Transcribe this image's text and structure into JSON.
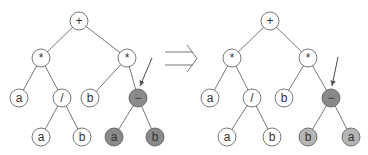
{
  "colors": {
    "line": "#555555",
    "node_fill": "#ffffff",
    "dark_fill": "#8a8a8a",
    "light_fill": "#b5b5b5"
  },
  "trees": [
    {
      "name": "before",
      "nodes": [
        {
          "id": "n0",
          "label": "+",
          "x": 79,
          "y": 21,
          "fill": "node_fill"
        },
        {
          "id": "n1",
          "label": "*",
          "x": 41,
          "y": 58,
          "fill": "node_fill"
        },
        {
          "id": "n2",
          "label": "*",
          "x": 127,
          "y": 58,
          "fill": "node_fill"
        },
        {
          "id": "n3",
          "label": "a",
          "x": 19,
          "y": 98,
          "fill": "node_fill"
        },
        {
          "id": "n4",
          "label": "/",
          "x": 62,
          "y": 98,
          "fill": "node_fill"
        },
        {
          "id": "n5",
          "label": "b",
          "x": 90,
          "y": 98,
          "fill": "node_fill"
        },
        {
          "id": "n6",
          "label": "−",
          "x": 138,
          "y": 98,
          "fill": "dark_fill"
        },
        {
          "id": "n7",
          "label": "a",
          "x": 41,
          "y": 137,
          "fill": "node_fill"
        },
        {
          "id": "n8",
          "label": "b",
          "x": 82,
          "y": 137,
          "fill": "node_fill"
        },
        {
          "id": "n9",
          "label": "a",
          "x": 114,
          "y": 137,
          "fill": "dark_fill"
        },
        {
          "id": "n10",
          "label": "b",
          "x": 155,
          "y": 137,
          "fill": "dark_fill"
        }
      ],
      "edges": [
        [
          "n0",
          "n1"
        ],
        [
          "n0",
          "n2"
        ],
        [
          "n1",
          "n3"
        ],
        [
          "n1",
          "n4"
        ],
        [
          "n2",
          "n5"
        ],
        [
          "n2",
          "n6"
        ],
        [
          "n4",
          "n7"
        ],
        [
          "n4",
          "n8"
        ],
        [
          "n6",
          "n9"
        ],
        [
          "n6",
          "n10"
        ]
      ],
      "pointer": {
        "x1": 152,
        "y1": 58,
        "x2": 140,
        "y2": 86
      }
    },
    {
      "name": "after",
      "nodes": [
        {
          "id": "m0",
          "label": "+",
          "x": 270,
          "y": 21,
          "fill": "node_fill"
        },
        {
          "id": "m1",
          "label": "*",
          "x": 232,
          "y": 58,
          "fill": "node_fill"
        },
        {
          "id": "m2",
          "label": "*",
          "x": 308,
          "y": 58,
          "fill": "node_fill"
        },
        {
          "id": "m3",
          "label": "a",
          "x": 210,
          "y": 98,
          "fill": "node_fill"
        },
        {
          "id": "m4",
          "label": "/",
          "x": 252,
          "y": 98,
          "fill": "node_fill"
        },
        {
          "id": "m5",
          "label": "b",
          "x": 284,
          "y": 98,
          "fill": "node_fill"
        },
        {
          "id": "m6",
          "label": "−",
          "x": 331,
          "y": 98,
          "fill": "dark_fill"
        },
        {
          "id": "m7",
          "label": "a",
          "x": 227,
          "y": 137,
          "fill": "node_fill"
        },
        {
          "id": "m8",
          "label": "b",
          "x": 272,
          "y": 137,
          "fill": "node_fill"
        },
        {
          "id": "m9",
          "label": "b",
          "x": 308,
          "y": 137,
          "fill": "light_fill"
        },
        {
          "id": "m10",
          "label": "a",
          "x": 351,
          "y": 137,
          "fill": "light_fill"
        }
      ],
      "edges": [
        [
          "m0",
          "m1"
        ],
        [
          "m0",
          "m2"
        ],
        [
          "m1",
          "m3"
        ],
        [
          "m1",
          "m4"
        ],
        [
          "m2",
          "m5"
        ],
        [
          "m2",
          "m6"
        ],
        [
          "m4",
          "m7"
        ],
        [
          "m4",
          "m8"
        ],
        [
          "m6",
          "m9"
        ],
        [
          "m6",
          "m10"
        ]
      ],
      "pointer": {
        "x1": 338,
        "y1": 57,
        "x2": 332,
        "y2": 86
      }
    }
  ],
  "transform_arrow": {
    "x1": 165,
    "x2": 197,
    "y_top": 52,
    "y_bottom": 65,
    "symbol": "⇒"
  }
}
